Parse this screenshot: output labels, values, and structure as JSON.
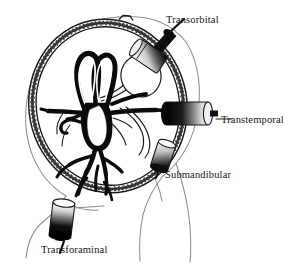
{
  "figure": {
    "background_color": "#ffffff",
    "ink_color": "#141414",
    "outline_color": "#8a8a8a"
  },
  "labels": {
    "transorbital": "Transorbital",
    "transtemporal": "Transtemporal",
    "submandibular": "Submandibular",
    "transforaminal": "Transforaminal"
  },
  "anatomy": {
    "head_outline": "head-profile",
    "skull_cross_section": "skull-ring",
    "vasculature": "circle-of-willis",
    "orbit": "eye-globe",
    "neck": "neck-contour"
  },
  "probes": {
    "transorbital": {
      "name": "transorbital-probe",
      "orientation": "tilted",
      "cap_color": "#111111"
    },
    "transtemporal": {
      "name": "transtemporal-probe",
      "orientation": "horizontal",
      "cap_color": "#111111"
    },
    "submandibular": {
      "name": "submandibular-probe",
      "orientation": "tilted",
      "cap_color": "#111111"
    },
    "transforaminal": {
      "name": "transforaminal-probe",
      "orientation": "vertical",
      "cap_color": "#111111"
    }
  }
}
